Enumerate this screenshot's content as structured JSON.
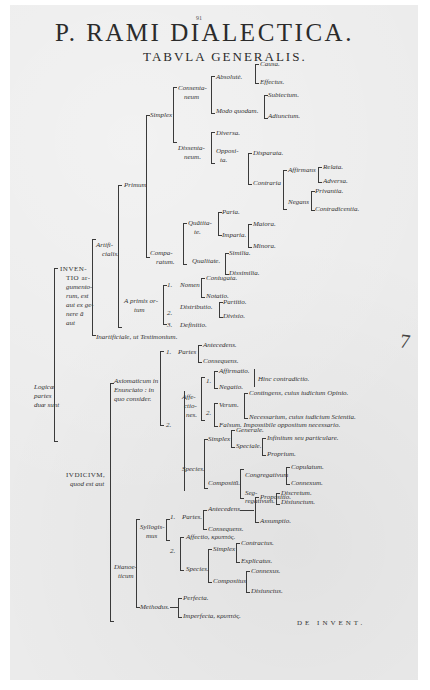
{
  "page": {
    "page_number": "91",
    "title": "P. RAMI DIALECTICA.",
    "subtitle": "TABVLA GENERALIS.",
    "catchword": "DE INVENT.",
    "margin_mark": "7",
    "background_color": "#ebebeb",
    "ink_color": "#2a2a2a"
  },
  "tree": {
    "root": "Logicæ partes duæ sunt",
    "inventio": {
      "label": [
        "INVEN-",
        "TIO ar-",
        "gumento-",
        "rum, est",
        "aut ex ge-",
        "nere ā",
        "aut"
      ],
      "artificialis": {
        "label": [
          "Artifi-",
          "cialis."
        ],
        "primum": {
          "label": "Primum",
          "simplex": {
            "label": "Simplex",
            "consentaneum": {
              "label": [
                "Consenta-",
                "neum"
              ],
              "absolute": {
                "label": "Absolutè.",
                "children": [
                  "Causa.",
                  "Effectus."
                ]
              },
              "modo_quodam": {
                "label": "Modo quodam.",
                "children": [
                  "Subiectum.",
                  "Adiunctum."
                ]
              }
            },
            "dissentaneum": {
              "label": [
                "Dissenta-",
                "neum."
              ],
              "diversa": "Diversa.",
              "opposita": {
                "label": [
                  "Opposi-",
                  "ta."
                ],
                "disparata": "Disparata.",
                "contraria": {
                  "label": "Contraria",
                  "affirmans": {
                    "label": "Affirmans",
                    "children": [
                      "Relata.",
                      "Adversa."
                    ]
                  },
                  "negans": {
                    "label": "Negans",
                    "children": [
                      "Privantia.",
                      "Contradicentia."
                    ]
                  }
                }
              }
            }
          },
          "comparatum": {
            "label": [
              "Compa-",
              "ratum."
            ],
            "quantitate": {
              "label": [
                "Quãtita-",
                "te."
              ],
              "paria": "Paria.",
              "imparia": {
                "label": "Imparia.",
                "children": [
                  "Maiora.",
                  "Minora."
                ]
              }
            },
            "qualitate": {
              "label": "Qualitate.",
              "children": [
                "Similia.",
                "Dissimilia."
              ]
            }
          }
        },
        "a_primis_ortum": {
          "label": [
            "A primis or-",
            "tum"
          ],
          "items": [
            {
              "num": "1.",
              "label": "Nomen",
              "children": [
                "Coniugata.",
                "Notatio."
              ]
            },
            {
              "num": "",
              "label": "",
              "children": []
            },
            {
              "num": "2.",
              "label": "Distributio.",
              "children": [
                "Partitio.",
                "Divisio."
              ]
            },
            {
              "num": "3.",
              "label": "Definitio.",
              "children": []
            }
          ]
        }
      },
      "inartificialis": "Inartificiale, ut Testimonium."
    },
    "iudicium": {
      "label": [
        "IVDICIVM,",
        "quod est aut"
      ],
      "axiomaticum": {
        "label": [
          "Axiomaticum in",
          "Enunciato : in",
          "quo consider."
        ],
        "partes": {
          "num": "1.",
          "label": "Partes",
          "children": [
            "Antecedens.",
            "Consequens."
          ]
        },
        "affectiones": {
          "num": "2.",
          "label": [
            "Affe-",
            "ctio-",
            "nes."
          ],
          "first": {
            "num": "1.",
            "children": [
              "Affirmatio.",
              "Negatio."
            ],
            "note": "Hinc contradictio."
          },
          "second": {
            "num": "2.",
            "verum": {
              "label": "Verum.",
              "children": [
                "Contingens, cuius iudicium Opinio.",
                "Necessarium, cuius iudicium Scientia."
              ]
            },
            "falsum": "Falsum. Impossibile oppositum necessario."
          }
        },
        "species": {
          "label": "Species.",
          "simplex": {
            "label": "Simplex",
            "generale": "Generale.",
            "speciale": {
              "label": "Speciale.",
              "children": [
                "Infinitum seu particulare.",
                "Proprium."
              ]
            }
          },
          "compositum": {
            "label": "Compositū.",
            "congregativum": {
              "label": "Congregativum",
              "children": [
                "Copulatum.",
                "Connexum."
              ]
            },
            "segregativum": {
              "label": [
                "Seg-",
                "regativum."
              ],
              "children": [
                "Discretum.",
                "Disiunctum."
              ]
            }
          }
        }
      },
      "dianoeticum": {
        "label": [
          "Dianoe-",
          "ticum"
        ],
        "syllogismus": {
          "label": [
            "Syllogis-",
            "mus"
          ],
          "partes": {
            "num": "1.",
            "label": "Partes.",
            "antecedens": {
              "label": "Antecedens.",
              "children": [
                "Propositio.",
                "Assumptio."
              ]
            },
            "consequens": "Consequens."
          },
          "second": {
            "num": "2.",
            "affectio": "Affectio, κρυπτός.",
            "species": {
              "label": "Species.",
              "simplex": {
                "label": "Simplex",
                "children": [
                  "Contractus.",
                  "Explicatus."
                ]
              },
              "compositus": {
                "label": "Compositus",
                "children": [
                  "Connexus.",
                  "Disiunctus."
                ]
              }
            }
          }
        },
        "methodus": {
          "label": "Methodus.",
          "children": [
            "Perfecta.",
            "Imperfecta, κρυπτός."
          ]
        }
      }
    }
  }
}
